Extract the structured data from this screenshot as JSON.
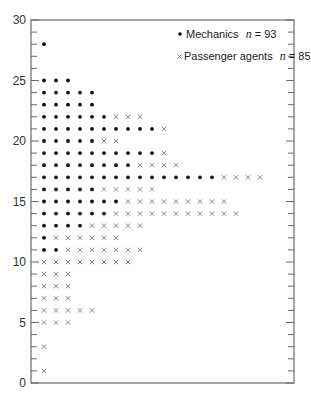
{
  "chart_data": {
    "type": "scatter",
    "subtype": "dot-plot",
    "title": "",
    "xlabel": "",
    "ylabel": "",
    "ylim": [
      0,
      30
    ],
    "yticks_major": [
      0,
      5,
      10,
      15,
      20,
      25,
      30
    ],
    "yticks_minor_step": 1,
    "grid": false,
    "legend_position": "upper right (inside)",
    "legend": [
      {
        "marker": "dot",
        "label": "Mechanics",
        "n_label": "n = 93",
        "n": 93
      },
      {
        "marker": "cross",
        "label": "Passenger agents",
        "n_label": "n = 85",
        "n": 85
      }
    ],
    "series": [
      {
        "name": "Mechanics",
        "marker": "dot",
        "color": "#111111",
        "counts_by_value": {
          "28": 1,
          "25": 3,
          "24": 5,
          "23": 5,
          "22": 6,
          "21": 10,
          "20": 5,
          "19": 10,
          "18": 8,
          "17": 15,
          "16": 5,
          "15": 7,
          "14": 6,
          "13": 4,
          "12": 1,
          "11": 2
        }
      },
      {
        "name": "Passenger agents",
        "marker": "cross",
        "color": "#777777",
        "counts_by_value": {
          "22": 3,
          "21": 1,
          "20": 2,
          "19": 1,
          "18": 4,
          "17": 4,
          "16": 5,
          "15": 9,
          "14": 11,
          "13": 5,
          "12": 6,
          "11": 7,
          "10": 8,
          "9": 3,
          "8": 3,
          "7": 3,
          "6": 5,
          "5": 3,
          "3": 1,
          "1": 1
        }
      }
    ]
  },
  "axis": {
    "labels": [
      "0",
      "5",
      "10",
      "15",
      "20",
      "25",
      "30"
    ]
  },
  "legend": {
    "mechanics_label": "Mechanics",
    "mechanics_n": "n",
    "mechanics_eq": " = 93",
    "agents_label": "Passenger agents",
    "agents_n": "n",
    "agents_eq": " = 85",
    "dot_glyph": "•",
    "cross_glyph": "×"
  }
}
